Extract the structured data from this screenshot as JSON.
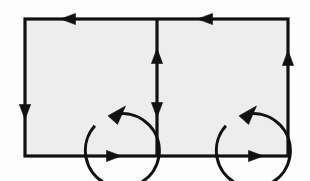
{
  "figure": {
    "canvas": {
      "width": 310,
      "height": 181
    }
  },
  "colors": {
    "page_background": "#fdfdfd",
    "cell_fill": "#ededed",
    "stroke": "#111111",
    "arrow_fill": "#111111"
  },
  "geometry": {
    "outer_rect": {
      "x": 25,
      "y": 19,
      "width": 263,
      "height": 137
    },
    "divider_x": 157,
    "stroke_width": 3.2,
    "circle_stroke_width": 3.0
  },
  "cells": [
    {
      "name": "left-cell",
      "label": "Left cell",
      "rect": {
        "x": 25,
        "y": 19,
        "width": 132,
        "height": 137
      },
      "circulation": {
        "direction": "counterclockwise",
        "center": {
          "cx": 91,
          "cy": 89
        },
        "radius": 37,
        "gap_start_deg": 276,
        "gap_end_deg": 318,
        "arrowhead_angle_deg": 318
      }
    },
    {
      "name": "right-cell",
      "label": "Right cell",
      "rect": {
        "x": 157,
        "y": 19,
        "width": 131,
        "height": 137
      },
      "circulation": {
        "direction": "counterclockwise",
        "center": {
          "cx": 222,
          "cy": 89
        },
        "radius": 37,
        "gap_start_deg": 276,
        "gap_end_deg": 318,
        "arrowhead_angle_deg": 318
      }
    }
  ],
  "boundary_arrows": [
    {
      "name": "top-left-arrow",
      "edge": "top",
      "direction": "left",
      "x": 68,
      "y": 19,
      "label": "leftward"
    },
    {
      "name": "top-right-arrow",
      "edge": "top",
      "direction": "left",
      "x": 205,
      "y": 19,
      "label": "leftward"
    },
    {
      "name": "bottom-left-arrow",
      "edge": "bottom",
      "direction": "right",
      "x": 114,
      "y": 156,
      "label": "rightward"
    },
    {
      "name": "bottom-right-arrow",
      "edge": "bottom",
      "direction": "right",
      "x": 256,
      "y": 156,
      "label": "rightward"
    },
    {
      "name": "left-edge-arrow",
      "edge": "left",
      "direction": "down",
      "x": 25,
      "y": 112,
      "label": "downward"
    },
    {
      "name": "right-edge-arrow",
      "edge": "right",
      "direction": "up",
      "x": 288,
      "y": 58,
      "label": "upward"
    }
  ],
  "divider_arrows": [
    {
      "name": "divider-up-arrow",
      "direction": "up",
      "x": 157,
      "y": 56,
      "label": "upward"
    },
    {
      "name": "divider-down-arrow",
      "direction": "down",
      "x": 157,
      "y": 110,
      "label": "downward"
    }
  ]
}
